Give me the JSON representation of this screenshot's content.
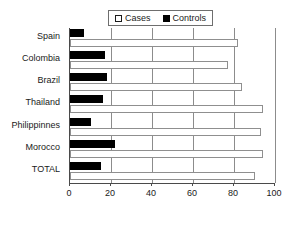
{
  "chart_data": {
    "type": "bar",
    "orientation": "horizontal",
    "title": "",
    "xlabel": "",
    "ylabel": "",
    "xlim": [
      0,
      100
    ],
    "xticks": [
      0,
      20,
      40,
      60,
      80,
      100
    ],
    "grid": true,
    "legend_position": "top-center",
    "categories": [
      "Spain",
      "Colombia",
      "Brazil",
      "Thailand",
      "Philippinnes",
      "Morocco",
      "TOTAL"
    ],
    "series": [
      {
        "name": "Cases",
        "color": "#ffffff",
        "edge_color": "#8f8f8f",
        "values": [
          82,
          77,
          84,
          94,
          93,
          94,
          90
        ]
      },
      {
        "name": "Controls",
        "color": "#000000",
        "edge_color": "#000000",
        "values": [
          7,
          17,
          18,
          16,
          10,
          22,
          15
        ]
      }
    ]
  },
  "legend": {
    "items": [
      {
        "label": "Cases",
        "swatch": "hollow-square"
      },
      {
        "label": "Controls",
        "swatch": "filled-square"
      }
    ]
  },
  "axis": {
    "x_tick_labels": [
      "0",
      "20",
      "40",
      "60",
      "80",
      "100"
    ]
  }
}
